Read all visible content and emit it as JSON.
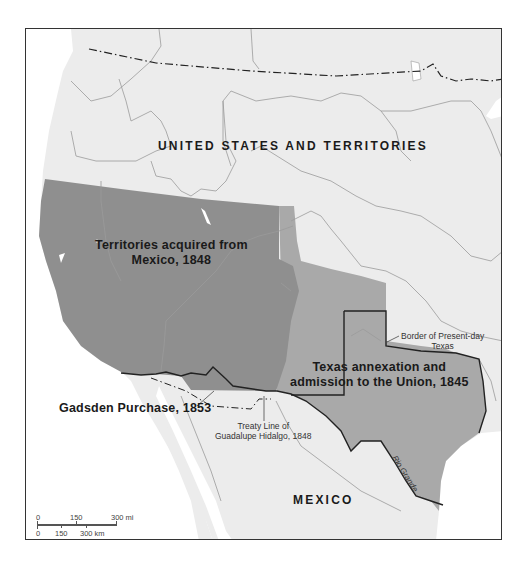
{
  "map": {
    "type": "historical territorial map",
    "colors": {
      "frame_border": "#333333",
      "land_us": "#ececec",
      "water": "#ffffff",
      "mexican_cession": "#8f8f8f",
      "texas_annexation": "#a9a9a9",
      "boundary_lines": "#9a9a9a",
      "bold_borders": "#222222"
    },
    "labels": {
      "united_states": "UNITED STATES AND TERRITORIES",
      "mexican_cession_line1": "Territories acquired from",
      "mexican_cession_line2": "Mexico, 1848",
      "texas_line1": "Texas annexation and",
      "texas_line2": "admission to the Union, 1845",
      "gadsden": "Gadsden Purchase, 1853",
      "treaty_line1": "Treaty Line of",
      "treaty_line2": "Guadalupe Hidalgo, 1848",
      "present_texas_line1": "Border of Present-day",
      "present_texas_line2": "Texas",
      "mexico": "MEXICO",
      "river": "Rio Grande"
    },
    "legend_regions": [
      {
        "name": "Territories acquired from Mexico, 1848",
        "color": "#8f8f8f"
      },
      {
        "name": "Texas annexation and admission to the Union, 1845",
        "color": "#a9a9a9"
      },
      {
        "name": "Gadsden Purchase, 1853",
        "color": "#ececec"
      }
    ],
    "scale_bar": {
      "miles": {
        "ticks": [
          "0",
          "150",
          "300 mi"
        ]
      },
      "kilometers": {
        "ticks": [
          "0",
          "150",
          "300 km"
        ]
      }
    }
  }
}
